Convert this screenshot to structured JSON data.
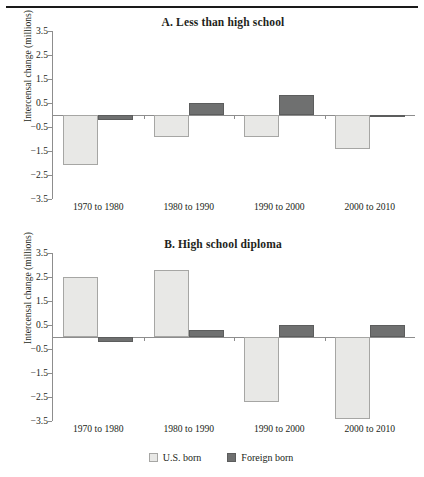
{
  "figure": {
    "has_top_rule": true,
    "legend": [
      {
        "key": "us",
        "label": "U.S. born",
        "color": "#e8e8e6"
      },
      {
        "key": "fb",
        "label": "Foreign born",
        "color": "#6f7070"
      }
    ]
  },
  "chart_data": [
    {
      "type": "bar",
      "panel": "A",
      "title": "A. Less than high school",
      "xlabel": "",
      "ylabel": "Intercensal change (millions)",
      "ylim": [
        -3.5,
        3.5
      ],
      "yticks": [
        3.5,
        2.5,
        1.5,
        0.5,
        -0.5,
        -1.5,
        -2.5,
        -3.5
      ],
      "ytick_labels": [
        "3.5",
        "2.5",
        "1.5",
        "0.5",
        "-0.5",
        "-1.5",
        "-2.5",
        "-3.5"
      ],
      "grid": false,
      "legend_position": "bottom",
      "categories": [
        "1970 to 1980",
        "1980 to 1990",
        "1990 to 2000",
        "2000 to 2010"
      ],
      "series": [
        {
          "name": "U.S. born",
          "color": "#e8e8e6",
          "values": [
            -2.1,
            -0.9,
            -0.9,
            -1.4
          ]
        },
        {
          "name": "Foreign born",
          "color": "#6f7070",
          "values": [
            -0.2,
            0.5,
            0.85,
            -0.05
          ]
        }
      ]
    },
    {
      "type": "bar",
      "panel": "B",
      "title": "B.  High school diploma",
      "xlabel": "",
      "ylabel": "Intercensal change (millions)",
      "ylim": [
        -3.5,
        3.5
      ],
      "yticks": [
        3.5,
        2.5,
        1.5,
        0.5,
        -0.5,
        -1.5,
        -2.5,
        -3.5
      ],
      "ytick_labels": [
        "3.5",
        "2.5",
        "1.5",
        "0.5",
        "-0.5",
        "-1.5",
        "-2.5",
        "-3.5"
      ],
      "grid": false,
      "legend_position": "bottom",
      "categories": [
        "1970 to 1980",
        "1980 to 1990",
        "1990 to 2000",
        "2000 to 2010"
      ],
      "series": [
        {
          "name": "U.S. born",
          "color": "#e8e8e6",
          "values": [
            2.5,
            2.8,
            -2.7,
            -3.4
          ]
        },
        {
          "name": "Foreign born",
          "color": "#6f7070",
          "values": [
            -0.2,
            0.3,
            0.5,
            0.5
          ]
        }
      ]
    }
  ]
}
